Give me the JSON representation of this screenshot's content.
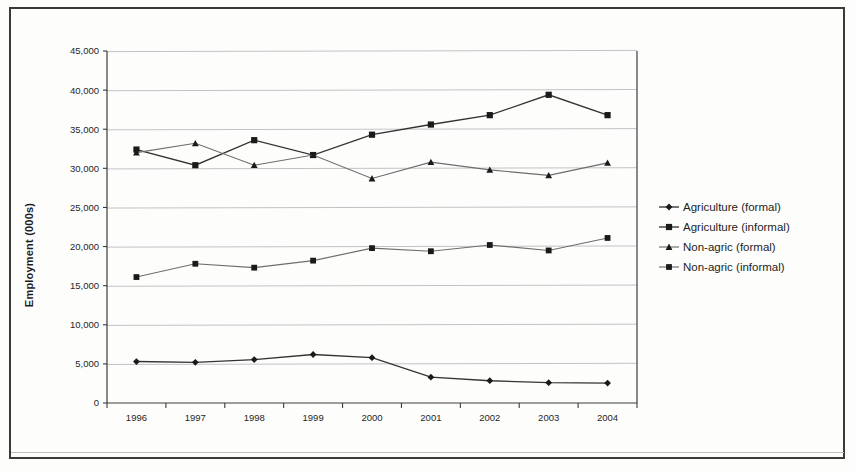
{
  "chart_data": {
    "type": "line",
    "title": "",
    "xlabel": "",
    "ylabel": "Employment (000s)",
    "categories": [
      "1996",
      "1997",
      "1998",
      "1999",
      "2000",
      "2001",
      "2002",
      "2003",
      "2004"
    ],
    "x": [
      1996,
      1997,
      1998,
      1999,
      2000,
      2001,
      2002,
      2003,
      2004
    ],
    "ylim": [
      0,
      45000
    ],
    "yticks": [
      0,
      5000,
      10000,
      15000,
      20000,
      25000,
      30000,
      35000,
      40000,
      45000
    ],
    "ytick_labels": [
      "0",
      "5,000",
      "10,000",
      "15,000",
      "20,000",
      "25,000",
      "30,000",
      "35,000",
      "40,000",
      "45,000"
    ],
    "grid": true,
    "legend_position": "right",
    "series": [
      {
        "name": "Agriculture (formal)",
        "marker": "diamond",
        "values": [
          5300,
          5200,
          5550,
          6200,
          5800,
          3300,
          2850,
          2600,
          2550
        ]
      },
      {
        "name": "Agriculture (informal)",
        "marker": "square",
        "values": [
          32400,
          30400,
          33600,
          31700,
          34300,
          35600,
          36800,
          39400,
          36800
        ]
      },
      {
        "name": "Non-agric (formal)",
        "marker": "triangle",
        "values": [
          32000,
          33200,
          30400,
          31700,
          28700,
          30800,
          29800,
          29100,
          30700
        ]
      },
      {
        "name": "Non-agric (informal)",
        "marker": "square-small",
        "values": [
          16100,
          17800,
          17300,
          18200,
          19800,
          19400,
          20200,
          19500,
          21100
        ]
      }
    ]
  },
  "legend": {
    "items": [
      {
        "label": "Agriculture (formal)",
        "marker": "diamond"
      },
      {
        "label": "Agriculture (informal)",
        "marker": "square"
      },
      {
        "label": "Non-agric (formal)",
        "marker": "triangle"
      },
      {
        "label": "Non-agric (informal)",
        "marker": "square-small"
      }
    ]
  },
  "axes": {
    "y_title": "Employment (000s)"
  }
}
